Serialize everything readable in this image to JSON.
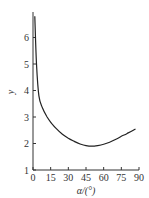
{
  "chart_data": {
    "type": "line",
    "title": "",
    "xlabel": "α/(°)",
    "ylabel": "y",
    "xlim": [
      0,
      90
    ],
    "ylim": [
      1,
      7
    ],
    "grid": false,
    "xticks": [
      "0",
      "15",
      "30",
      "45",
      "60",
      "75",
      "90"
    ],
    "yticks": [
      "1",
      "2",
      "3",
      "4",
      "5",
      "6"
    ],
    "series": [
      {
        "name": "y",
        "x": [
          1.5,
          3,
          5,
          8,
          12,
          16,
          20,
          25,
          30,
          35,
          40,
          45,
          50,
          55,
          60,
          65,
          70,
          75,
          80,
          87
        ],
        "values": [
          6.8,
          5.0,
          3.8,
          3.35,
          3.0,
          2.75,
          2.55,
          2.35,
          2.2,
          2.08,
          1.98,
          1.92,
          1.9,
          1.92,
          1.97,
          2.05,
          2.15,
          2.27,
          2.38,
          2.55
        ]
      }
    ]
  }
}
